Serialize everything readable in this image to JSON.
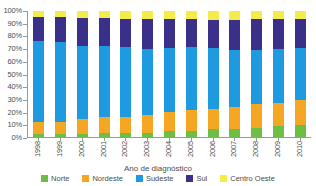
{
  "chart_data": {
    "type": "bar",
    "stacked": true,
    "stack_mode": "percent",
    "title": "",
    "xlabel": "Ano de diagnóstico",
    "ylabel": "",
    "ylim": [
      0,
      100
    ],
    "ytick_labels": [
      "100%",
      "90%",
      "80%",
      "70%",
      "60%",
      "50%",
      "40%",
      "30%",
      "20%",
      "10%",
      "0%"
    ],
    "ytick_values": [
      100,
      90,
      80,
      70,
      60,
      50,
      40,
      30,
      20,
      10,
      0
    ],
    "grid": false,
    "legend_position": "bottom",
    "categories": [
      "1998",
      "1999",
      "2000",
      "2001",
      "2002",
      "2003",
      "2004",
      "2005",
      "2006",
      "2007",
      "2008",
      "2009",
      "2010"
    ],
    "series": [
      {
        "name": "Norte",
        "color": "#6cbe45",
        "values": [
          2.0,
          2.0,
          2.5,
          3.0,
          3.5,
          3.5,
          5.0,
          5.0,
          6.0,
          6.5,
          7.0,
          8.5,
          9.5
        ]
      },
      {
        "name": "Nordeste",
        "color": "#f5a623",
        "values": [
          10.0,
          10.0,
          11.5,
          13.0,
          12.5,
          14.0,
          15.0,
          16.5,
          16.5,
          17.5,
          19.0,
          18.5,
          19.5
        ]
      },
      {
        "name": "Sudeste",
        "color": "#1e9be0",
        "values": [
          64.0,
          63.5,
          58.5,
          56.0,
          55.5,
          52.5,
          50.5,
          50.0,
          48.5,
          45.0,
          43.0,
          43.0,
          42.0
        ]
      },
      {
        "name": "Sul",
        "color": "#3b3089",
        "values": [
          19.0,
          20.0,
          22.0,
          22.5,
          22.5,
          23.5,
          23.0,
          22.0,
          22.0,
          24.0,
          25.0,
          23.5,
          22.5
        ]
      },
      {
        "name": "Centro Oeste",
        "color": "#f3ec4a",
        "values": [
          5.0,
          4.5,
          5.5,
          5.5,
          6.0,
          6.5,
          6.5,
          6.5,
          7.0,
          7.0,
          6.0,
          6.5,
          6.5
        ]
      }
    ]
  },
  "axis": {
    "x_title": "Ano de diagnóstico"
  },
  "legend": {
    "items": [
      {
        "label": "Norte",
        "color": "#6cbe45"
      },
      {
        "label": "Nordeste",
        "color": "#f5a623"
      },
      {
        "label": "Sudeste",
        "color": "#1e9be0"
      },
      {
        "label": "Sul",
        "color": "#3b3089"
      },
      {
        "label": "Centro Oeste",
        "color": "#f3ec4a"
      }
    ]
  }
}
